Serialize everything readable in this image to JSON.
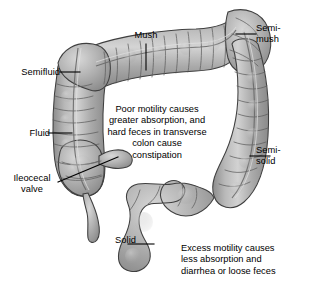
{
  "figure": {
    "background_color": "#ffffff",
    "organ_fill": "#a9a9a9",
    "organ_fill_light": "#cfcfcf",
    "organ_fill_dark": "#8e8e8e",
    "outline_color": "#3a3a3a",
    "text_color": "#000000",
    "leader_line_color": "#000000"
  },
  "labels": {
    "semifluid": "Semifluid",
    "fluid": "Fluid",
    "ileocecal_valve": "Ileocecal\nvalve",
    "mush": "Mush",
    "semi_mush": "Semi-\nmush",
    "semi_solid": "Semi-\nsolid",
    "solid": "Solid"
  },
  "annotations": {
    "poor_motility": "Poor motility causes\ngreater absorption, and\nhard feces in transverse\ncolon cause\nconstipation",
    "excess_motility": "Excess motility causes\nless absorption and\ndiarrhea or loose feces"
  }
}
